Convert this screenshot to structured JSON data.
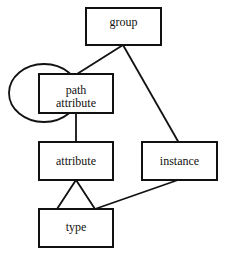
{
  "diagram": {
    "nodes": [
      {
        "id": "group",
        "label": "group"
      },
      {
        "id": "path_attribute",
        "label_line1": "path",
        "label_line2": "attribute"
      },
      {
        "id": "attribute",
        "label": "attribute"
      },
      {
        "id": "instance",
        "label": "instance"
      },
      {
        "id": "type",
        "label": "type"
      }
    ],
    "edges": [
      {
        "from": "group",
        "to": "path_attribute"
      },
      {
        "from": "group",
        "to": "instance"
      },
      {
        "from": "path_attribute",
        "to": "path_attribute",
        "kind": "self-loop"
      },
      {
        "from": "path_attribute",
        "to": "attribute"
      },
      {
        "from": "attribute",
        "to": "type",
        "kind": "triangle"
      },
      {
        "from": "instance",
        "to": "type"
      }
    ],
    "colors": {
      "stroke": "#111111",
      "background": "#ffffff"
    }
  }
}
